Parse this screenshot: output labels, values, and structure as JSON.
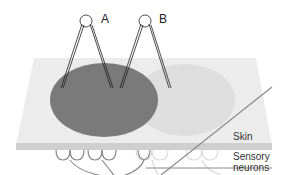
{
  "diagram": {
    "probes": [
      {
        "label": "A"
      },
      {
        "label": "B"
      }
    ],
    "layers": {
      "skin": "Skin",
      "neurons_line1": "Sensory",
      "neurons_line2": "neurons"
    },
    "colors": {
      "skin_top": "#ececec",
      "skin_edge": "#cfcfcf",
      "field_a": "#7a7a7a",
      "field_b": "#dedede",
      "neuron_a": "#8a8a8a",
      "neuron_b": "#dcdcdc"
    }
  }
}
